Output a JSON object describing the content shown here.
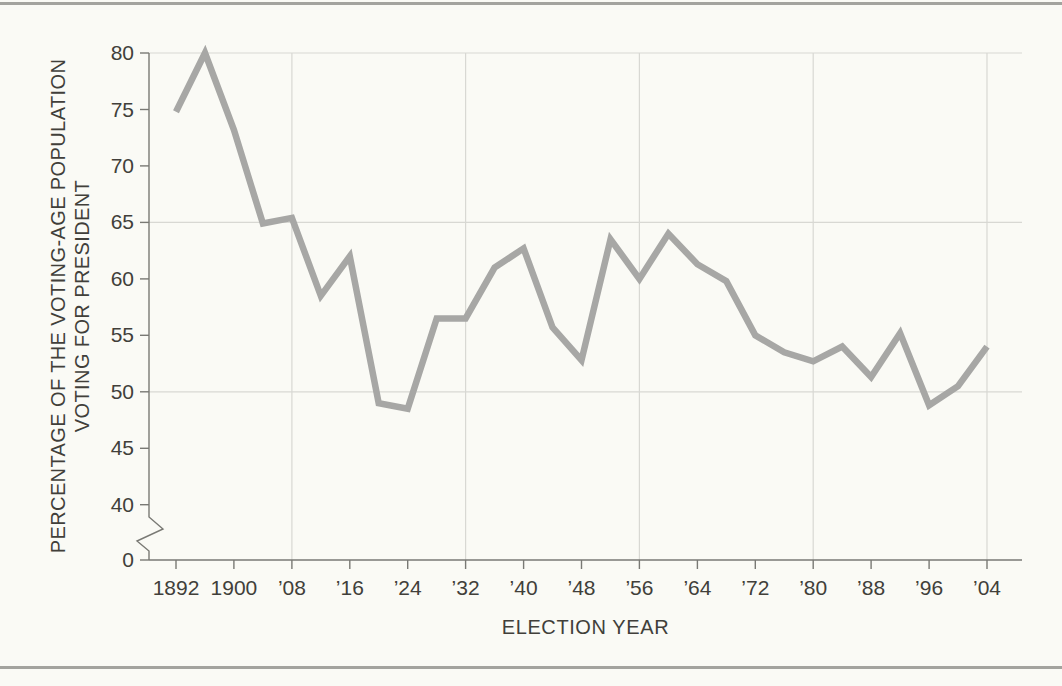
{
  "page": {
    "background": "#fafaf5",
    "rule_color": "#a3a39e"
  },
  "chart_data": {
    "type": "line",
    "title": "",
    "xlabel": "ELECTION YEAR",
    "ylabel_line1": "PERCENTAGE OF THE VOTING-AGE POPULATION",
    "ylabel_line2": "VOTING FOR PRESIDENT",
    "x": [
      1892,
      1896,
      1900,
      1904,
      1908,
      1912,
      1916,
      1920,
      1924,
      1928,
      1932,
      1936,
      1940,
      1944,
      1948,
      1952,
      1956,
      1960,
      1964,
      1968,
      1972,
      1976,
      1980,
      1984,
      1988,
      1992,
      1996,
      2000,
      2004
    ],
    "values": [
      74.8,
      80,
      73.2,
      64.9,
      65.4,
      58.5,
      62,
      49,
      48.5,
      56.5,
      56.5,
      61,
      62.7,
      55.7,
      52.8,
      63.5,
      60,
      64,
      61.3,
      59.8,
      55,
      53.5,
      52.7,
      54,
      51.3,
      55.2,
      48.8,
      50.5,
      54
    ],
    "y_ticks": [
      {
        "value": 80,
        "label": "80"
      },
      {
        "value": 75,
        "label": "75"
      },
      {
        "value": 70,
        "label": "70"
      },
      {
        "value": 65,
        "label": "65"
      },
      {
        "value": 60,
        "label": "60"
      },
      {
        "value": 55,
        "label": "55"
      },
      {
        "value": 50,
        "label": "50"
      },
      {
        "value": 45,
        "label": "45"
      },
      {
        "value": 40,
        "label": "40"
      },
      {
        "value": 0,
        "label": "0"
      }
    ],
    "x_ticks": [
      {
        "year": 1892,
        "label": "1892"
      },
      {
        "year": 1900,
        "label": "1900"
      },
      {
        "year": 1908,
        "label": "’08"
      },
      {
        "year": 1916,
        "label": "’16"
      },
      {
        "year": 1924,
        "label": "’24"
      },
      {
        "year": 1932,
        "label": "’32"
      },
      {
        "year": 1940,
        "label": "’40"
      },
      {
        "year": 1948,
        "label": "’48"
      },
      {
        "year": 1956,
        "label": "’56"
      },
      {
        "year": 1964,
        "label": "’64"
      },
      {
        "year": 1972,
        "label": "’72"
      },
      {
        "year": 1980,
        "label": "’80"
      },
      {
        "year": 1988,
        "label": "’88"
      },
      {
        "year": 1996,
        "label": "’96"
      },
      {
        "year": 2004,
        "label": "’04"
      }
    ],
    "y_gridlines": [
      80,
      65,
      50
    ],
    "x_gridline_years": [
      1908,
      1932,
      1956,
      1980,
      2004
    ],
    "y_axis_break": true,
    "xlim": [
      1892,
      2004
    ],
    "ylim": [
      0,
      80
    ],
    "legend": "none",
    "line_color": "#a7a7a5",
    "grid_color": "#d8d8d3",
    "axis_color": "#797974",
    "text_color": "#413f3a"
  }
}
